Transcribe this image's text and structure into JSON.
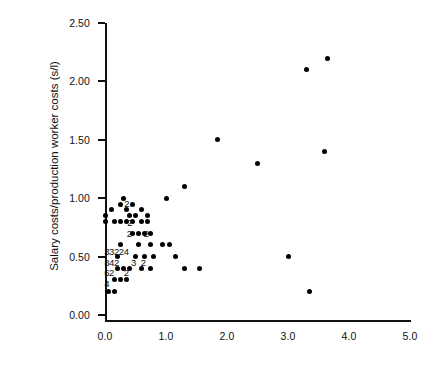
{
  "chart_data": {
    "type": "scatter",
    "title": "",
    "xlabel": "",
    "ylabel": "Salary costs/production worker costs (s/l)",
    "xlim": [
      0.0,
      5.0
    ],
    "ylim": [
      0.0,
      2.5
    ],
    "grid": false,
    "legend": null,
    "xticks": [
      "0.0",
      "1.0",
      "2.0",
      "3.0",
      "4.0",
      "5.0"
    ],
    "xtick_values": [
      0.0,
      1.0,
      2.0,
      3.0,
      4.0,
      5.0
    ],
    "yticks": [
      "0.00",
      "0.50",
      "1.00",
      "1.50",
      "2.00",
      "2.50"
    ],
    "ytick_values": [
      0.0,
      0.5,
      1.0,
      1.5,
      2.0,
      2.5
    ],
    "marker": "filled-circle",
    "marker_color": "#000000",
    "points": [
      {
        "x": 0.3,
        "y": 1.0
      },
      {
        "x": 0.25,
        "y": 0.95
      },
      {
        "x": 0.45,
        "y": 0.95
      },
      {
        "x": 0.1,
        "y": 0.9
      },
      {
        "x": 0.35,
        "y": 0.9
      },
      {
        "x": 0.6,
        "y": 0.9
      },
      {
        "x": 0.0,
        "y": 0.85
      },
      {
        "x": 0.4,
        "y": 0.85
      },
      {
        "x": 0.5,
        "y": 0.85
      },
      {
        "x": 0.7,
        "y": 0.85
      },
      {
        "x": 0.0,
        "y": 0.8
      },
      {
        "x": 0.15,
        "y": 0.8
      },
      {
        "x": 0.25,
        "y": 0.8
      },
      {
        "x": 0.35,
        "y": 0.8
      },
      {
        "x": 0.45,
        "y": 0.8
      },
      {
        "x": 0.6,
        "y": 0.8
      },
      {
        "x": 0.7,
        "y": 0.8
      },
      {
        "x": 0.45,
        "y": 0.7
      },
      {
        "x": 0.55,
        "y": 0.7
      },
      {
        "x": 0.65,
        "y": 0.7
      },
      {
        "x": 0.75,
        "y": 0.7
      },
      {
        "x": 0.25,
        "y": 0.6
      },
      {
        "x": 0.55,
        "y": 0.6
      },
      {
        "x": 0.75,
        "y": 0.6
      },
      {
        "x": 0.95,
        "y": 0.6
      },
      {
        "x": 0.2,
        "y": 0.5
      },
      {
        "x": 0.5,
        "y": 0.5
      },
      {
        "x": 0.65,
        "y": 0.5
      },
      {
        "x": 0.8,
        "y": 0.5
      },
      {
        "x": 0.2,
        "y": 0.4
      },
      {
        "x": 0.3,
        "y": 0.4
      },
      {
        "x": 0.4,
        "y": 0.4
      },
      {
        "x": 0.6,
        "y": 0.4
      },
      {
        "x": 0.75,
        "y": 0.4
      },
      {
        "x": 0.15,
        "y": 0.3
      },
      {
        "x": 0.25,
        "y": 0.3
      },
      {
        "x": 0.35,
        "y": 0.3
      },
      {
        "x": 0.05,
        "y": 0.2
      },
      {
        "x": 0.15,
        "y": 0.2
      },
      {
        "x": 1.0,
        "y": 1.0
      },
      {
        "x": 1.3,
        "y": 1.1
      },
      {
        "x": 1.85,
        "y": 1.5
      },
      {
        "x": 2.5,
        "y": 1.3
      },
      {
        "x": 3.3,
        "y": 2.1
      },
      {
        "x": 3.65,
        "y": 2.2
      },
      {
        "x": 3.6,
        "y": 1.4
      },
      {
        "x": 1.05,
        "y": 0.6
      },
      {
        "x": 1.15,
        "y": 0.5
      },
      {
        "x": 1.3,
        "y": 0.4
      },
      {
        "x": 1.55,
        "y": 0.4
      },
      {
        "x": 3.0,
        "y": 0.5
      },
      {
        "x": 3.35,
        "y": 0.2
      }
    ],
    "overplot_counts": [
      {
        "x": 0.36,
        "y": 0.955,
        "label": "2"
      },
      {
        "x": 0.41,
        "y": 0.8,
        "label": "2"
      },
      {
        "x": 0.4,
        "y": 0.7,
        "label": "2"
      },
      {
        "x": 0.68,
        "y": 0.7,
        "label": "2"
      },
      {
        "x": 0.03,
        "y": 0.545,
        "label": "3"
      },
      {
        "x": 0.11,
        "y": 0.545,
        "label": "3"
      },
      {
        "x": 0.19,
        "y": 0.545,
        "label": "2"
      },
      {
        "x": 0.27,
        "y": 0.545,
        "label": "2"
      },
      {
        "x": 0.35,
        "y": 0.545,
        "label": "4"
      },
      {
        "x": 0.03,
        "y": 0.455,
        "label": "8"
      },
      {
        "x": 0.11,
        "y": 0.455,
        "label": "4"
      },
      {
        "x": 0.19,
        "y": 0.455,
        "label": "2"
      },
      {
        "x": 0.47,
        "y": 0.455,
        "label": "3"
      },
      {
        "x": 0.63,
        "y": 0.455,
        "label": "2"
      },
      {
        "x": 0.03,
        "y": 0.365,
        "label": "6"
      },
      {
        "x": 0.11,
        "y": 0.365,
        "label": "2"
      },
      {
        "x": 0.35,
        "y": 0.365,
        "label": "2"
      },
      {
        "x": 0.03,
        "y": 0.275,
        "label": "4"
      }
    ]
  }
}
